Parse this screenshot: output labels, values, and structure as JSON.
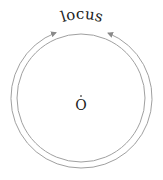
{
  "diagram": {
    "title_label": "locus",
    "center_label": "O",
    "colors": {
      "line": "#9a9a9a",
      "text": "#222222",
      "background": "#ffffff"
    }
  }
}
